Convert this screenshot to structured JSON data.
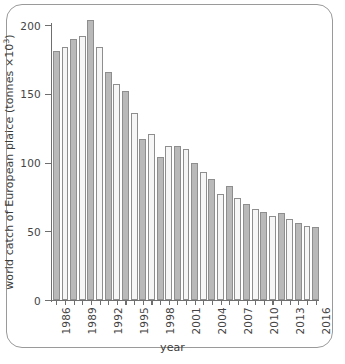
{
  "figure": {
    "frame": "rounded-rectangle",
    "background": "#ffffff",
    "border_color": "#9a9a9a"
  },
  "chart_data": {
    "type": "bar",
    "title": "",
    "xlabel": "year",
    "ylabel_plain": "world catch of European plaice (tonnes x10^3)",
    "ylabel_prefix": "world catch of European plaice (tonnes ×10",
    "ylabel_exponent": "3",
    "ylabel_suffix": ")",
    "ylim": [
      0,
      205
    ],
    "yticks": [
      0,
      50,
      100,
      150,
      200
    ],
    "ytick_labels": [
      "0",
      "50",
      "100",
      "150",
      "200"
    ],
    "xtick_labels": [
      "1986",
      "1989",
      "1992",
      "1995",
      "1998",
      "2001",
      "2004",
      "2007",
      "2010",
      "2013",
      "2016"
    ],
    "xtick_years": [
      1986,
      1989,
      1992,
      1995,
      1998,
      2001,
      2004,
      2007,
      2010,
      2013,
      2016
    ],
    "grid": false,
    "legend": null,
    "bar_colors": {
      "odd": "#b9b9b9",
      "even": "#f6f6f6",
      "edge": "#8e8e8e"
    },
    "categories": [
      "1986",
      "1987",
      "1988",
      "1989",
      "1990",
      "1991",
      "1992",
      "1993",
      "1994",
      "1995",
      "1996",
      "1997",
      "1998",
      "1999",
      "2000",
      "2001",
      "2002",
      "2003",
      "2004",
      "2005",
      "2006",
      "2007",
      "2008",
      "2009",
      "2010",
      "2011",
      "2012",
      "2013",
      "2014",
      "2015",
      "2016"
    ],
    "values": [
      181,
      184,
      190,
      192,
      204,
      184,
      166,
      157,
      152,
      136,
      117,
      121,
      104,
      112,
      112,
      110,
      100,
      93,
      88,
      77,
      83,
      74,
      70,
      66,
      64,
      61,
      63,
      59,
      56,
      54,
      53
    ]
  }
}
